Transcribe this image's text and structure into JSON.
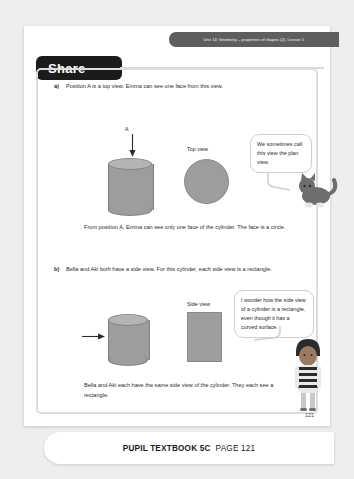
{
  "page": {
    "unit_header": "Unit 14: Geometry – properties of shapes (2), Lesson 5",
    "section_title": "Share",
    "page_number": "121"
  },
  "part_a": {
    "marker": "a)",
    "question": "Position A is a top view. Emma can see one face from this view.",
    "position_label": "A",
    "view_label": "Top view",
    "conclusion": "From position A, Emma can see only one face of the cylinder. The face is a circle.",
    "bubble": "We sometimes call this view the plan view."
  },
  "part_b": {
    "marker": "b)",
    "question": "Bella and Aki both have a side view. For this cylinder, each side view is a rectangle.",
    "view_label": "Side view",
    "conclusion": "Bella and Aki each have the same side view of the cylinder. They each see a rectangle.",
    "bubble": "I wonder how the side view of a cylinder is a rectangle, even though it has a curved surface."
  },
  "footer": {
    "book": "PUPIL TEXTBOOK 5C",
    "page": "PAGE 121"
  },
  "colors": {
    "shape_fill": "#9d9d9d",
    "shape_top": "#b4b4b4",
    "tab_background": "#1b1b1b",
    "unit_strip": "#5e5e5e"
  }
}
